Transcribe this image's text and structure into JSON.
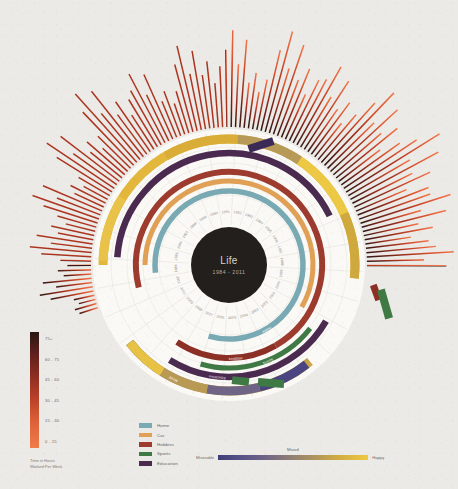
{
  "poster": {
    "center_title": "Life",
    "center_subtitle": "1984 - 2011",
    "background_color": "#eceae6"
  },
  "hours_legend": {
    "caption_line1": "Time in Hours",
    "caption_line2": "Worked Per Week",
    "ticks": [
      "75+",
      "60 - 75",
      "45 - 60",
      "30 - 45",
      "15 - 30",
      "0 - 15"
    ],
    "gradient_top": "#2a1713",
    "gradient_bottom": "#f07c4a"
  },
  "category_legend": {
    "items": [
      {
        "label": "Home",
        "color": "#79aab4"
      },
      {
        "label": "Car",
        "color": "#e0a055"
      },
      {
        "label": "Hobbies",
        "color": "#9c3b2e"
      },
      {
        "label": "Sports",
        "color": "#3f7a45"
      },
      {
        "label": "Education",
        "color": "#4b2a50"
      }
    ]
  },
  "mood_legend": {
    "title": "Mood",
    "low_label": "Miserable",
    "high_label": "Happy",
    "low_color": "#3e3f77",
    "high_color": "#efc941"
  },
  "years": [
    "1984",
    "1985",
    "1986",
    "1987",
    "1988",
    "1989",
    "1990",
    "1991",
    "1992",
    "1993",
    "1994",
    "1995",
    "1996",
    "1997",
    "1998",
    "1999",
    "2000",
    "2001",
    "2002",
    "2003",
    "2004",
    "2005",
    "2006",
    "2007",
    "2008",
    "2009",
    "2010",
    "2011"
  ],
  "chart_data": {
    "type": "bar",
    "title": "Life 1984 - 2011",
    "subtitle": "Hours worked per week, by year",
    "xlabel": "Year",
    "ylabel": "Hours Worked Per Week",
    "ylim": [
      0,
      90
    ],
    "grid": false,
    "legend_position": "bottom",
    "categories": [
      "1984",
      "1985",
      "1986",
      "1987",
      "1988",
      "1989",
      "1990",
      "1991",
      "1992",
      "1993",
      "1994",
      "1995",
      "1996",
      "1997",
      "1998",
      "1999",
      "2000",
      "2001",
      "2002",
      "2003",
      "2004",
      "2005",
      "2006",
      "2007",
      "2008",
      "2009",
      "2010",
      "2011"
    ],
    "series": [
      {
        "name": "Hours Worked Per Week",
        "values": [
          12,
          38,
          21,
          45,
          30,
          52,
          26,
          61,
          35,
          70,
          44,
          58,
          33,
          66,
          49,
          74,
          40,
          80,
          55,
          68,
          47,
          77,
          59,
          85,
          63,
          72,
          51,
          66
        ]
      }
    ],
    "rings": [
      {
        "name": "Home",
        "color": "#79aab4",
        "label": "Home"
      },
      {
        "name": "Car",
        "color": "#e0a055",
        "label": "Car"
      },
      {
        "name": "Hobbies",
        "color": "#9c3b2e",
        "label": "Hobbies"
      },
      {
        "name": "Sports",
        "color": "#3f7a45",
        "label": "Sports"
      },
      {
        "name": "Education",
        "color": "#4b2a50",
        "label": "Education"
      },
      {
        "name": "Mood",
        "color": "#e3b63c",
        "label": "Mood"
      }
    ]
  }
}
